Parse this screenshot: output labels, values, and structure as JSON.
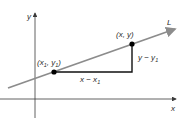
{
  "diagram": {
    "axes": {
      "x_label": "x",
      "y_label": "y"
    },
    "line": {
      "label": "L",
      "color": "#8c8c8c"
    },
    "points": [
      {
        "label_main": "(x",
        "label_sub": "1",
        "label_sep": ", y",
        "label_sub2": "1",
        "label_end": ")",
        "name": "point-1"
      },
      {
        "label": "(x, y)",
        "name": "point-2"
      }
    ],
    "segments": {
      "horizontal_label_main": "x − x",
      "horizontal_label_sub": "1",
      "vertical_label_main": "y − y",
      "vertical_label_sub": "1"
    },
    "colors": {
      "axis": "#3a3a3a",
      "line": "#8c8c8c",
      "segment": "#111111",
      "point": "#000000",
      "text": "#2b2b2b"
    }
  }
}
